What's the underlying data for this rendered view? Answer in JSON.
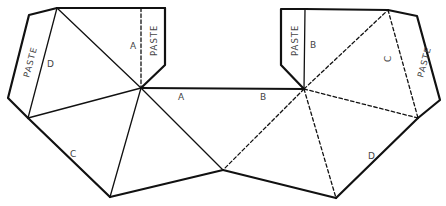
{
  "diagram": {
    "edge_labels": {
      "a_left_tab": "A",
      "a_middle": "A",
      "b_middle": "B",
      "b_right_tab": "B",
      "c_left": "C",
      "c_right_tab": "C",
      "d_left_tab": "D",
      "d_right": "D"
    },
    "tab_labels": {
      "left": "PASTE",
      "top_left": "PASTE",
      "top_right": "PASTE",
      "right": "PASTE"
    },
    "line_styles": {
      "cut": "solid heavy",
      "fold_left": "solid",
      "fold_right": "dashed"
    },
    "colors": {
      "line": "#111111",
      "label": "#444444",
      "background": "#ffffff"
    }
  }
}
